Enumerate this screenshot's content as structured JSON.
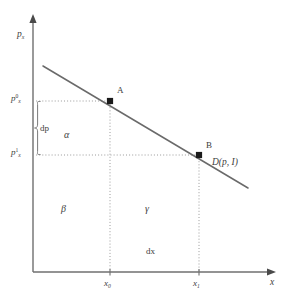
{
  "figure": {
    "type": "economics-demand-curve-diagram",
    "background_color": "#ffffff",
    "line_color": "#6a6a6a",
    "guide_color": "#9a9a9a",
    "text_color": "#3d3d3d",
    "marker_color": "#1a1a1a"
  },
  "axes": {
    "y_axis": {
      "label_main": "p",
      "label_sub": "x",
      "origin_px": [
        33,
        272
      ],
      "top_px": [
        33,
        18
      ]
    },
    "x_axis": {
      "label_main": "x",
      "origin_px": [
        33,
        272
      ],
      "right_px": [
        272,
        272
      ]
    }
  },
  "y_ticks": [
    {
      "id": "p0",
      "label_main": "p",
      "label_sub": "x",
      "label_sup": "0",
      "y_px": 101
    },
    {
      "id": "p1",
      "label_main": "p",
      "label_sub": "x",
      "label_sup": "1",
      "y_px": 155
    }
  ],
  "x_ticks": [
    {
      "id": "x0",
      "label_main": "x",
      "label_sub": "0",
      "x_px": 110
    },
    {
      "id": "x1",
      "label_main": "x",
      "label_sub": "1",
      "x_px": 199
    }
  ],
  "points": [
    {
      "id": "A",
      "label": "A",
      "x_px": 110,
      "y_px": 101
    },
    {
      "id": "B",
      "label": "B",
      "x_px": 199,
      "y_px": 155
    }
  ],
  "demand_curve": {
    "label_text": "D(p, I)",
    "start_px": [
      43,
      66
    ],
    "end_px": [
      248,
      188
    ]
  },
  "annotations": {
    "dp": {
      "text": "dp",
      "x_px": 40,
      "y_px": 129
    },
    "dx": {
      "text": "dx",
      "x_px": 148,
      "y_px": 252
    },
    "alpha": {
      "text": "α",
      "x_px": 64,
      "y_px": 135
    },
    "beta": {
      "text": "β",
      "x_px": 62,
      "y_px": 209
    },
    "gamma": {
      "text": "γ",
      "x_px": 146,
      "y_px": 209
    }
  }
}
